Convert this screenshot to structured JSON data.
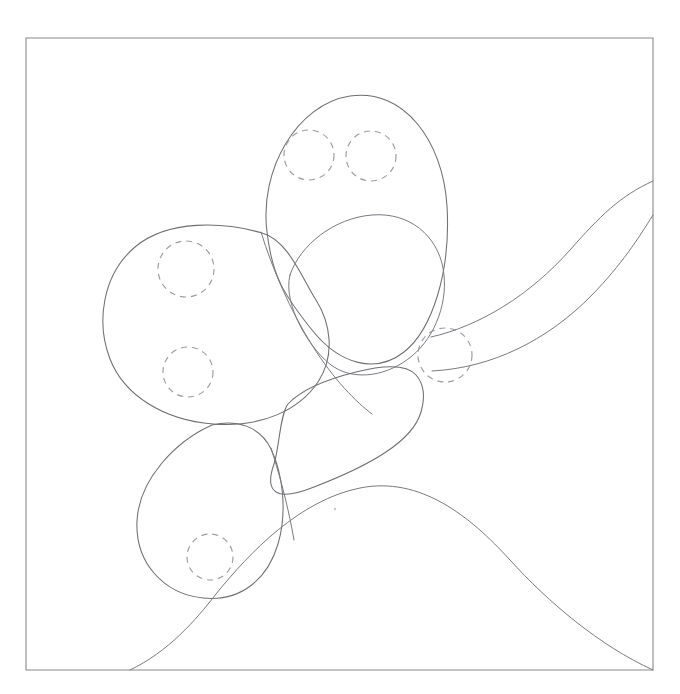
{
  "canvas": {
    "width": 680,
    "height": 694,
    "background": "#ffffff",
    "title": "Butterfly line drawing"
  },
  "palette": {
    "frame_stroke": "#8a8a8a",
    "ink_stroke": "#6e6e73",
    "soft_stroke": "#7a7a80",
    "dashed_stroke": "#9a9aa2",
    "speck_fill": "#c9c9d2",
    "background": "#ffffff"
  },
  "frame": {
    "label": "drawing-border",
    "x": 26,
    "y": 38,
    "width": 627,
    "height": 632,
    "path": "M26 38 L653 38 L653 670 L26 670 Z"
  },
  "scene": {
    "subject": "butterfly",
    "setting": "branch and hill",
    "elements": [
      "upper-wing",
      "left-wing",
      "lower-wing",
      "inner-wing",
      "body",
      "head",
      "branch",
      "hill"
    ]
  },
  "shapes": {
    "upper_wing": {
      "label": "upper-wing-outline",
      "path": "M267 232 C259 170 297 104 350 96 C403 88 443 140 447 206 C451 272 432 330 404 352 C376 374 340 365 312 330 C284 295 272 276 267 232 Z"
    },
    "left_wing": {
      "label": "left-wing-outline",
      "path": "M262 233 C224 222 168 219 135 247 C102 275 96 323 110 359 C124 395 163 420 213 424 C263 428 300 409 318 382 C336 355 330 322 316 300 C302 278 288 240 262 233 Z"
    },
    "lower_wing": {
      "label": "lower-wing-outline",
      "path": "M212 425 C176 441 139 479 137 521 C135 563 164 594 203 598 C242 602 268 578 278 544 C288 510 282 472 271 449 C260 426 236 419 212 425 Z"
    },
    "inner_wing": {
      "label": "inner-wing-overlap",
      "path": "M290 275 C300 245 334 218 372 215 C410 212 437 236 443 268 C449 300 436 336 412 356 C388 376 356 381 334 367 C312 353 282 305 290 275 Z"
    },
    "wing_seam_left": {
      "label": "wing-seam-left",
      "path": "M261 232 C272 268 290 310 312 345 C334 380 356 402 372 414"
    },
    "wing_seam_lower": {
      "label": "wing-seam-lower",
      "path": "M271 448 C282 482 290 516 294 540"
    },
    "body": {
      "label": "butterfly-body",
      "path": "M288 404 C300 391 324 380 356 372 C388 364 408 366 416 375 C424 384 425 398 421 412 C417 426 404 440 386 452 C368 464 340 477 314 487 C294 495 282 496 276 492 C270 488 269 478 274 464 C279 450 280 414 288 404 Z"
    },
    "head": {
      "label": "head-spot",
      "cx": 445,
      "cy": 355,
      "r": 27
    },
    "branch_upper": {
      "label": "branch-upper-edge",
      "path": "M431 337 C480 326 530 295 570 250 C600 216 620 196 653 181"
    },
    "branch_lower": {
      "label": "branch-lower-edge",
      "path": "M432 371 C492 368 548 340 592 295 C622 264 638 239 653 215"
    },
    "hill": {
      "label": "hill-horizon",
      "path": "M130 670 C168 652 196 620 216 594 C250 552 300 500 360 488 C420 476 470 516 510 560 C548 602 600 646 653 670"
    },
    "speck": {
      "label": "ink-speck",
      "cx": 335,
      "cy": 509,
      "r": 1.2
    }
  },
  "spots": [
    {
      "label": "upper-wing-spot-left",
      "cx": 309,
      "cy": 155,
      "r": 25
    },
    {
      "label": "upper-wing-spot-right",
      "cx": 371,
      "cy": 156,
      "r": 25
    },
    {
      "label": "left-wing-spot-upper",
      "cx": 186,
      "cy": 269,
      "r": 28
    },
    {
      "label": "left-wing-spot-lower",
      "cx": 188,
      "cy": 372,
      "r": 25
    },
    {
      "label": "lower-wing-spot",
      "cx": 210,
      "cy": 557,
      "r": 23
    }
  ]
}
